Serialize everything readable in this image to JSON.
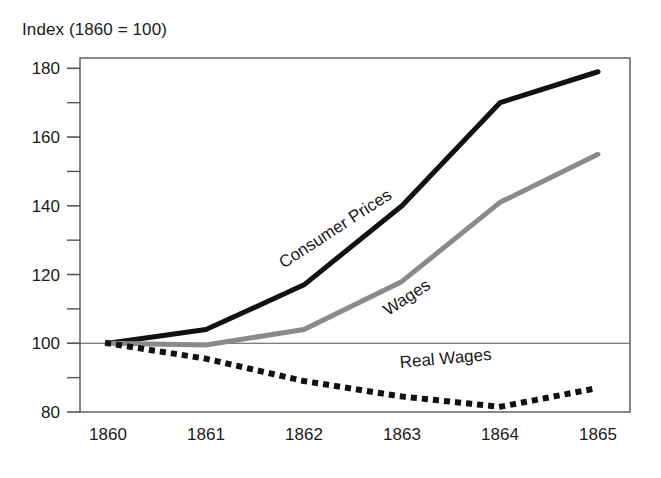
{
  "chart_data": {
    "type": "line",
    "title": "Index (1860 = 100)",
    "xlabel": "",
    "ylabel": "Index (1860 = 100)",
    "x": [
      1860,
      1861,
      1862,
      1863,
      1864,
      1865
    ],
    "xticklabels": [
      "1860",
      "1861",
      "1862",
      "1863",
      "1864",
      "1865"
    ],
    "yticklabels": [
      "80",
      "100",
      "120",
      "140",
      "160",
      "180"
    ],
    "ytickvalues": [
      80,
      100,
      120,
      140,
      160,
      180
    ],
    "yminorticks": [
      90,
      110,
      130,
      150,
      170
    ],
    "xlim": [
      1860,
      1865
    ],
    "ylim": [
      80,
      183
    ],
    "grid": "single horizontal reference line at 100",
    "reference_line": 100,
    "legend": "inline labels placed along each series",
    "series": [
      {
        "name": "Consumer Prices",
        "values": [
          100,
          104,
          117,
          140,
          170,
          179
        ],
        "color": "#111111",
        "style": "solid",
        "width": 5,
        "label_x": 1862.35,
        "label_y": 132,
        "label_rotation": -33
      },
      {
        "name": "Wages",
        "values": [
          100,
          99.5,
          104,
          118,
          141,
          155
        ],
        "color": "#8a8a8a",
        "style": "solid",
        "width": 5,
        "label_x": 1863.08,
        "label_y": 112,
        "label_rotation": -33
      },
      {
        "name": "Real Wages",
        "values": [
          100,
          95.5,
          89,
          84.5,
          81.5,
          87
        ],
        "color": "#111111",
        "style": "dotted",
        "width": 6,
        "label_x": 1863.45,
        "label_y": 94,
        "label_rotation": -5
      }
    ]
  },
  "axes": {
    "frame_color": "#555555",
    "reference_line_color": "#555555",
    "background": "#ffffff"
  }
}
